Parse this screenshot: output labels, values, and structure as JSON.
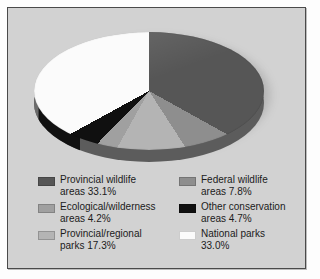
{
  "chart_data": {
    "type": "pie",
    "title": "",
    "three_d": true,
    "start_angle_deg": 0,
    "direction": "clockwise",
    "categories": [
      "Provincial wildlife areas",
      "Federal wildlife areas",
      "Provincial/regional parks",
      "Ecological/wilderness areas",
      "Other conservation areas",
      "National parks"
    ],
    "values": [
      33.1,
      7.8,
      17.3,
      4.2,
      4.7,
      33.0
    ],
    "value_unit": "%",
    "colors": [
      "#565656",
      "#8e8e8e",
      "#b4b4b4",
      "#a0a0a0",
      "#101010",
      "#fbfbfb"
    ],
    "legend_position": "bottom",
    "slices": [
      {
        "label": "Provincial wildlife areas",
        "value": 33.1,
        "color": "#565656"
      },
      {
        "label": "Federal wildlife areas",
        "value": 7.8,
        "color": "#8e8e8e"
      },
      {
        "label": "Provincial/regional parks",
        "value": 17.3,
        "color": "#b4b4b4"
      },
      {
        "label": "Ecological/wilderness areas",
        "value": 4.2,
        "color": "#a0a0a0"
      },
      {
        "label": "Other conservation areas",
        "value": 4.7,
        "color": "#101010"
      },
      {
        "label": "National parks",
        "value": 33.0,
        "color": "#fbfbfb"
      }
    ]
  },
  "legend": {
    "left_column": [
      {
        "line1": "Provincial wildlife",
        "line2": "areas 33.1%",
        "color": "#565656"
      },
      {
        "line1": "Ecological/wilderness",
        "line2": "areas 4.2%",
        "color": "#a0a0a0"
      },
      {
        "line1": "Provincial/regional",
        "line2": "parks 17.3%",
        "color": "#b4b4b4"
      }
    ],
    "right_column": [
      {
        "line1": "Federal wildlife",
        "line2": "areas 7.8%",
        "color": "#8e8e8e"
      },
      {
        "line1": "Other conservation",
        "line2": "areas 4.7%",
        "color": "#101010"
      },
      {
        "line1": "National parks",
        "line2": "33.0%",
        "color": "#fbfbfb"
      }
    ]
  },
  "theme": {
    "panel_background": "#d2d2d2",
    "panel_border": "#4a4a4a",
    "page_background": "#fdfdfd",
    "text_color": "#1b1b1b"
  }
}
